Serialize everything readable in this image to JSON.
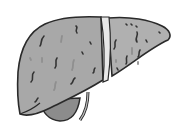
{
  "image": {
    "subject": "liver illustration",
    "alt": "Grayscale clipart of a diseased liver with spotted texture, falciform ligament, and gallbladder",
    "colors": {
      "background": "#ffffff",
      "lobe_fill": "#a8a8a8",
      "lobe_fill_right": "#b0b0b0",
      "outline": "#2a2a2a",
      "ligament": "#e8e8e8",
      "gallbladder": "#8c8c8c",
      "spots_dark": "#333333",
      "spots_light": "#909090"
    },
    "parts": [
      "right-lobe",
      "left-lobe",
      "falciform-ligament",
      "gallbladder",
      "hepatic-duct"
    ]
  }
}
